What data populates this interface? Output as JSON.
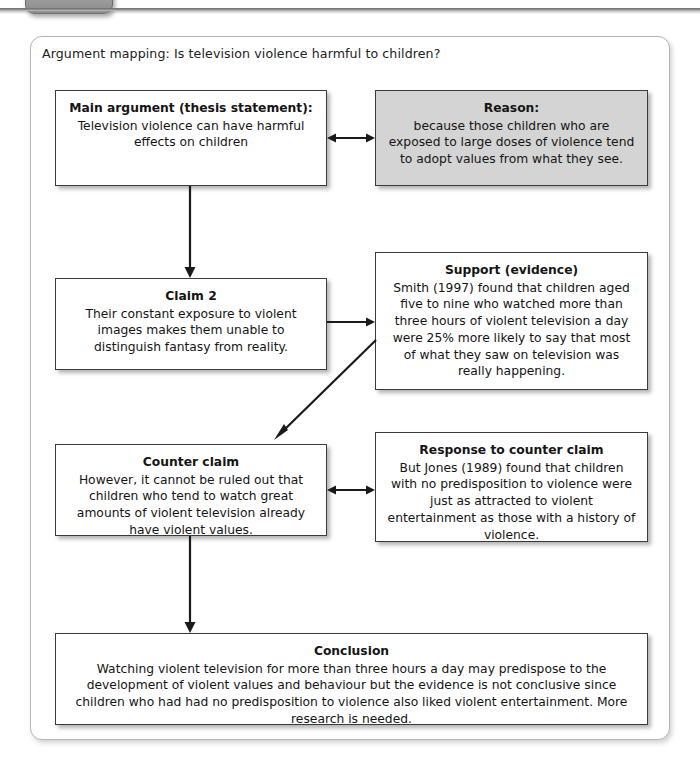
{
  "chrome": {
    "tab_icon": "rounded-tab",
    "rule_color": "#7d7d7d"
  },
  "panel": {
    "caption": "Argument mapping: Is television violence harmful to children?",
    "border_color": "#b6b6b6",
    "background": "#ffffff"
  },
  "diagram": {
    "title": "Argument mapping: Is television violence harmful to children?",
    "shaded_fill": "#d4d4d4",
    "box_border": "#3b3b3b",
    "nodes": [
      {
        "id": "main-argument",
        "title": "Main argument (thesis statement):",
        "body": "Television violence can have harmful effects on children",
        "shaded": false
      },
      {
        "id": "reason",
        "title": "Reason:",
        "body": "because those children who are exposed to large doses of violence tend to adopt values from what they see.",
        "shaded": true
      },
      {
        "id": "claim-2",
        "title": "Claim 2",
        "body": "Their constant exposure to violent images makes them unable to distinguish fantasy from reality.",
        "shaded": false
      },
      {
        "id": "support-evidence",
        "title": "Support (evidence)",
        "body": "Smith (1997) found that children aged five to nine who watched more than three hours of violent television a day were 25% more likely to say that most of what they saw on television was really happening.",
        "shaded": false
      },
      {
        "id": "counter-claim",
        "title": "Counter claim",
        "body": "However, it cannot be ruled out that children who tend to watch great amounts of violent television already have violent values.",
        "shaded": false
      },
      {
        "id": "response-to-counter-claim",
        "title": "Response to counter claim",
        "body": "But Jones (1989) found that children with no predisposition to violence were just as attracted to violent entertainment as those with a history of violence.",
        "shaded": false
      },
      {
        "id": "conclusion",
        "title": "Conclusion",
        "body": "Watching violent television for more than three hours a day may predispose to the development of violent values and behaviour but the evidence is not conclusive since children who had had no predisposition to violence also liked violent entertainment. More research is needed.",
        "shaded": false
      }
    ],
    "connectors": [
      {
        "id": "main-argument-to-reason",
        "from": "main-argument",
        "to": "reason",
        "kind": "double-arrow-horizontal"
      },
      {
        "id": "main-argument-to-claim-2",
        "from": "main-argument",
        "to": "claim-2",
        "kind": "arrow-down"
      },
      {
        "id": "claim-2-to-support",
        "from": "claim-2",
        "to": "support-evidence",
        "kind": "arrow-right"
      },
      {
        "id": "support-to-counter-claim",
        "from": "support-evidence",
        "to": "counter-claim",
        "kind": "arrow-diagonal-down-left"
      },
      {
        "id": "counter-claim-to-response",
        "from": "counter-claim",
        "to": "response-to-counter-claim",
        "kind": "double-arrow-horizontal"
      },
      {
        "id": "counter-claim-to-conclusion",
        "from": "counter-claim",
        "to": "conclusion",
        "kind": "arrow-down"
      }
    ]
  }
}
